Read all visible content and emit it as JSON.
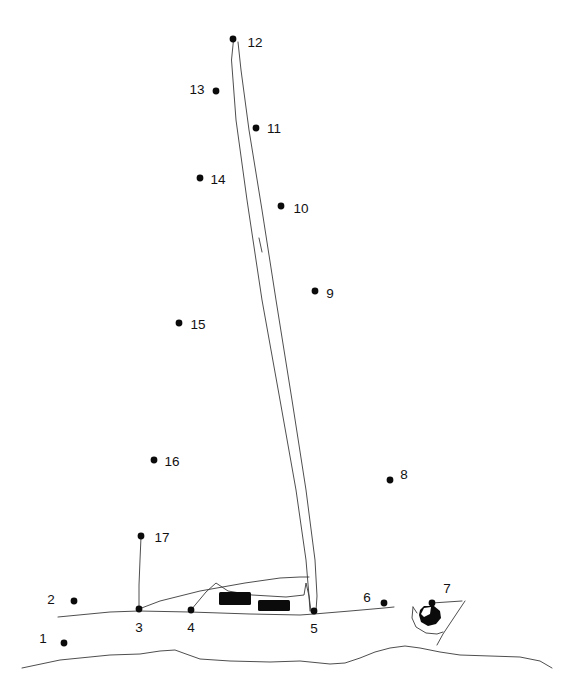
{
  "puzzle": {
    "kind": "connect-the-dots",
    "subject": "sailboat",
    "background_color": "#ffffff",
    "ink_color": "#0b0b0b",
    "line_color": "#2b2b2b",
    "width": 561,
    "height": 693,
    "dot_radius": 3.4,
    "label_font_size": 13.5
  },
  "dots": [
    {
      "number": "1",
      "x": 64,
      "y": 643,
      "label_x": 43,
      "label_y": 639,
      "label_anchor": "middle"
    },
    {
      "number": "2",
      "x": 74,
      "y": 601,
      "label_x": 51,
      "label_y": 600,
      "label_anchor": "middle"
    },
    {
      "number": "3",
      "x": 139,
      "y": 609,
      "label_x": 139,
      "label_y": 628,
      "label_anchor": "middle"
    },
    {
      "number": "4",
      "x": 191,
      "y": 610,
      "label_x": 191,
      "label_y": 628,
      "label_anchor": "middle"
    },
    {
      "number": "5",
      "x": 314,
      "y": 611,
      "label_x": 314,
      "label_y": 629,
      "label_anchor": "middle"
    },
    {
      "number": "6",
      "x": 384,
      "y": 603,
      "label_x": 367,
      "label_y": 598,
      "label_anchor": "middle"
    },
    {
      "number": "7",
      "x": 432,
      "y": 603,
      "label_x": 447,
      "label_y": 589,
      "label_anchor": "middle"
    },
    {
      "number": "8",
      "x": 390,
      "y": 480,
      "label_x": 404,
      "label_y": 475,
      "label_anchor": "middle"
    },
    {
      "number": "9",
      "x": 315,
      "y": 291,
      "label_x": 330,
      "label_y": 294,
      "label_anchor": "middle"
    },
    {
      "number": "10",
      "x": 281,
      "y": 206,
      "label_x": 301,
      "label_y": 209,
      "label_anchor": "middle"
    },
    {
      "number": "11",
      "x": 256,
      "y": 128,
      "label_x": 274,
      "label_y": 129,
      "label_anchor": "middle"
    },
    {
      "number": "12",
      "x": 233,
      "y": 39,
      "label_x": 255,
      "label_y": 43,
      "label_anchor": "middle"
    },
    {
      "number": "13",
      "x": 216,
      "y": 91,
      "label_x": 197,
      "label_y": 90,
      "label_anchor": "middle"
    },
    {
      "number": "14",
      "x": 200,
      "y": 178,
      "label_x": 218,
      "label_y": 180,
      "label_anchor": "middle"
    },
    {
      "number": "15",
      "x": 179,
      "y": 323,
      "label_x": 198,
      "label_y": 325,
      "label_anchor": "middle"
    },
    {
      "number": "16",
      "x": 154,
      "y": 460,
      "label_x": 172,
      "label_y": 462,
      "label_anchor": "middle"
    },
    {
      "number": "17",
      "x": 141,
      "y": 536,
      "label_x": 162,
      "label_y": 538,
      "label_anchor": "middle"
    }
  ],
  "drawn_strokes": {
    "mast_left": "M 233.5 40 L 231.5 60 L 236 120 L 247 200 L 262 300 L 280 400 L 296 490 L 306 560 L 309 596 L 310 611",
    "mast_right": "M 238 42 L 241 70 L 249 130 L 262 210 L 276 300 L 292 400 L 306 490 L 315 560 L 317 596 L 316 611",
    "mast_tick": "M 259 238 L 262 252",
    "forestay": "M 141 537 L 140 560 L 139 585 L 139 609",
    "jib_curve": "M 139 609 L 160 601 L 200 591 L 245 583 L 280 578 L 300 577 L 309 577",
    "cabin_outline": "M 191 610 L 206 592 L 216 583 L 228 591 L 252 595 L 286 597 L 304 595 L 306 583 L 309 596 L 311 611",
    "deck_line": "M 58 617 L 110 612 L 139 611 L 190 612 L 250 614 L 300 615 L 314 614 L 350 611 L 384 608 L 394 607",
    "water_line": "M 22 668 L 60 660 L 110 655 L 140 654 L 160 651 L 175 650 L 186 654 L 200 659 L 230 661 L 270 662 L 300 661 L 320 663 L 330 664 L 345 663 L 360 658 L 375 652 L 390 648 L 405 646 L 420 648 L 440 652 L 460 655 L 490 656 L 520 657 L 540 661 L 552 668",
    "buoy_hull_top": "M 432 603 L 462 601",
    "buoy_diag": "M 465 601 L 443 634 L 437 645",
    "buoy_arc": "M 413 607 L 412 618 L 416 627 L 426 633 L 437 634 L 443 632",
    "buoy_arc_tip": "M 413 607 L 417 613",
    "buoy_bowl": "M 418 608 L 430 605 L 440 608 L 443 616 L 438 624 L 428 627 L 419 623 L 416 615 Z"
  },
  "black_shapes": {
    "window_left": {
      "x": 219,
      "y": 592,
      "width": 32,
      "height": 13,
      "rx": 1.5
    },
    "window_right": {
      "x": 258,
      "y": 600,
      "width": 32,
      "height": 11,
      "rx": 1.5
    },
    "buoy_dark": "M 424 606 L 434 606 L 440 611 L 441 618 L 436 624 L 428 626 L 421 622 L 419 615 L 420 610 Z",
    "buoy_highlight": "M 424 608 L 431 607 L 430 614 L 424 617 L 421 614 Z"
  },
  "icon_names": {
    "dot": "dot-marker-icon",
    "buoy": "buoy-icon",
    "mast": "mast-icon",
    "sail": "sail-icon",
    "cabin": "cabin-icon",
    "water": "water-line-icon"
  }
}
